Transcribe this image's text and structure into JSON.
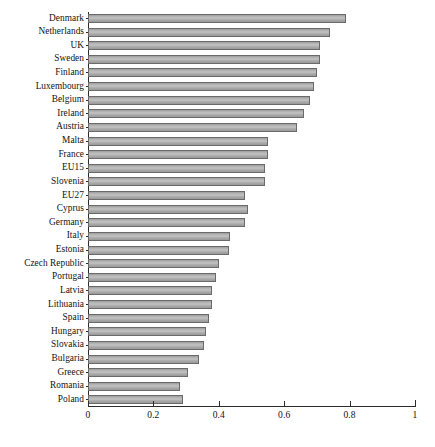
{
  "chart_data": {
    "type": "bar",
    "orientation": "horizontal",
    "title": "",
    "subtitle": "",
    "xlabel": "",
    "ylabel": "",
    "xlim": [
      0,
      1
    ],
    "grid": false,
    "legend": null,
    "legend_position": "none",
    "x_ticks": [
      "0",
      "0.2",
      "0.4",
      "0.6",
      "0.8",
      "1"
    ],
    "x_tick_values": [
      0,
      0.2,
      0.4,
      0.6,
      0.8,
      1
    ],
    "bar_color": "#b2b2b2",
    "bar_edge_color": "#6a6a6a",
    "axis_color": "#2b2b2b",
    "categories": [
      "Denmark",
      "Netherlands",
      "UK",
      "Sweden",
      "Finland",
      "Luxembourg",
      "Belgium",
      "Ireland",
      "Austria",
      "Malta",
      "France",
      "EU15",
      "Slovenia",
      "EU27",
      "Cyprus",
      "Germany",
      "Italy",
      "Estonia",
      "Czech Republic",
      "Portugal",
      "Latvia",
      "Lithuania",
      "Spain",
      "Hungary",
      "Slovakia",
      "Bulgaria",
      "Greece",
      "Romania",
      "Poland"
    ],
    "values": [
      0.79,
      0.74,
      0.71,
      0.71,
      0.7,
      0.69,
      0.68,
      0.66,
      0.64,
      0.55,
      0.55,
      0.54,
      0.54,
      0.48,
      0.49,
      0.48,
      0.435,
      0.43,
      0.4,
      0.39,
      0.38,
      0.38,
      0.37,
      0.36,
      0.355,
      0.34,
      0.305,
      0.28,
      0.29
    ]
  }
}
